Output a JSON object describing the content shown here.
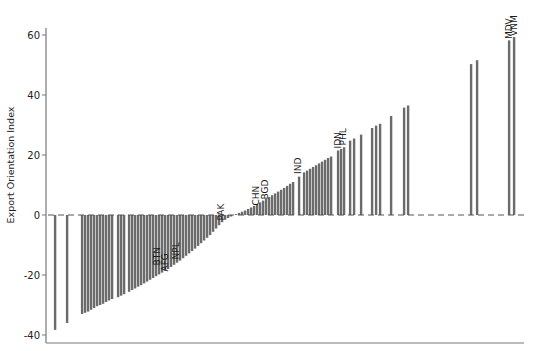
{
  "chart_data": {
    "type": "bar",
    "title": "",
    "xlabel": "",
    "ylabel": "Export Orientation Index",
    "ylim": [
      -43,
      63
    ],
    "yticks": [
      -40,
      -20,
      0,
      20,
      40,
      60
    ],
    "grid": false,
    "legend": null,
    "zero_line": "dashed",
    "bar_color": "#6b6b6b",
    "annotations": [
      {
        "label": "BTN",
        "x": 157,
        "value": -17.5
      },
      {
        "label": "AFG",
        "x": 165,
        "value": -19.5
      },
      {
        "label": "NPL",
        "x": 176,
        "value": -15.5
      },
      {
        "label": "PAK",
        "x": 221,
        "value": -2.5
      },
      {
        "label": "CHN",
        "x": 256,
        "value": 2.5
      },
      {
        "label": "BGD",
        "x": 265,
        "value": 4.5
      },
      {
        "label": "IND",
        "x": 298,
        "value": 13
      },
      {
        "label": "IDN",
        "x": 338,
        "value": 21.5
      },
      {
        "label": "PHL",
        "x": 343,
        "value": 22.5
      },
      {
        "label": "MDV",
        "x": 509,
        "value": 58
      },
      {
        "label": "VNM",
        "x": 514,
        "value": 59
      }
    ],
    "bars": [
      {
        "x": 55,
        "value": -38.3
      },
      {
        "x": 67,
        "value": -36.0
      },
      {
        "x": 82,
        "value": -33.0
      },
      {
        "x": 85,
        "value": -32.6
      },
      {
        "x": 88,
        "value": -32.2
      },
      {
        "x": 91,
        "value": -31.6
      },
      {
        "x": 94,
        "value": -31.0
      },
      {
        "x": 97,
        "value": -30.4
      },
      {
        "x": 100,
        "value": -30.0
      },
      {
        "x": 103,
        "value": -29.6
      },
      {
        "x": 106,
        "value": -29.0
      },
      {
        "x": 109,
        "value": -28.5
      },
      {
        "x": 112,
        "value": -28.0
      },
      {
        "x": 118,
        "value": -27.4
      },
      {
        "x": 121,
        "value": -26.9
      },
      {
        "x": 124,
        "value": -26.4
      },
      {
        "x": 129,
        "value": -25.6
      },
      {
        "x": 132,
        "value": -25.0
      },
      {
        "x": 135,
        "value": -24.5
      },
      {
        "x": 138,
        "value": -23.9
      },
      {
        "x": 141,
        "value": -23.4
      },
      {
        "x": 144,
        "value": -22.8
      },
      {
        "x": 147,
        "value": -22.2
      },
      {
        "x": 150,
        "value": -21.6
      },
      {
        "x": 153,
        "value": -21.0
      },
      {
        "x": 156,
        "value": -20.4
      },
      {
        "x": 159,
        "value": -19.8
      },
      {
        "x": 162,
        "value": -19.2
      },
      {
        "x": 165,
        "value": -18.6
      },
      {
        "x": 168,
        "value": -18.0
      },
      {
        "x": 171,
        "value": -17.3
      },
      {
        "x": 174,
        "value": -16.6
      },
      {
        "x": 177,
        "value": -15.9
      },
      {
        "x": 180,
        "value": -15.2
      },
      {
        "x": 183,
        "value": -14.4
      },
      {
        "x": 186,
        "value": -13.6
      },
      {
        "x": 189,
        "value": -12.8
      },
      {
        "x": 192,
        "value": -12.0
      },
      {
        "x": 195,
        "value": -11.2
      },
      {
        "x": 198,
        "value": -10.3
      },
      {
        "x": 201,
        "value": -9.4
      },
      {
        "x": 204,
        "value": -8.5
      },
      {
        "x": 207,
        "value": -7.6
      },
      {
        "x": 210,
        "value": -6.7
      },
      {
        "x": 213,
        "value": -5.6
      },
      {
        "x": 216,
        "value": -4.5
      },
      {
        "x": 219,
        "value": -3.4
      },
      {
        "x": 222,
        "value": -2.4
      },
      {
        "x": 225,
        "value": -1.6
      },
      {
        "x": 228,
        "value": -1.0
      },
      {
        "x": 231,
        "value": -0.5
      },
      {
        "x": 236,
        "value": 0.3
      },
      {
        "x": 239,
        "value": 0.7
      },
      {
        "x": 242,
        "value": 1.1
      },
      {
        "x": 245,
        "value": 1.5
      },
      {
        "x": 248,
        "value": 2.0
      },
      {
        "x": 251,
        "value": 2.5
      },
      {
        "x": 254,
        "value": 3.0
      },
      {
        "x": 257,
        "value": 3.6
      },
      {
        "x": 260,
        "value": 4.2
      },
      {
        "x": 263,
        "value": 4.8
      },
      {
        "x": 266,
        "value": 5.4
      },
      {
        "x": 269,
        "value": 6.0
      },
      {
        "x": 272,
        "value": 6.6
      },
      {
        "x": 275,
        "value": 7.2
      },
      {
        "x": 278,
        "value": 7.8
      },
      {
        "x": 281,
        "value": 8.4
      },
      {
        "x": 284,
        "value": 9.0
      },
      {
        "x": 287,
        "value": 9.7
      },
      {
        "x": 290,
        "value": 10.4
      },
      {
        "x": 293,
        "value": 11.0
      },
      {
        "x": 299,
        "value": 12.8
      },
      {
        "x": 304,
        "value": 14.2
      },
      {
        "x": 307,
        "value": 14.8
      },
      {
        "x": 310,
        "value": 15.4
      },
      {
        "x": 313,
        "value": 16.0
      },
      {
        "x": 316,
        "value": 16.6
      },
      {
        "x": 319,
        "value": 17.2
      },
      {
        "x": 322,
        "value": 17.8
      },
      {
        "x": 325,
        "value": 18.4
      },
      {
        "x": 328,
        "value": 19.0
      },
      {
        "x": 331,
        "value": 19.5
      },
      {
        "x": 338,
        "value": 21.5
      },
      {
        "x": 341,
        "value": 22.0
      },
      {
        "x": 344,
        "value": 22.6
      },
      {
        "x": 350,
        "value": 24.8
      },
      {
        "x": 354,
        "value": 25.5
      },
      {
        "x": 361,
        "value": 26.8
      },
      {
        "x": 372,
        "value": 29.0
      },
      {
        "x": 376,
        "value": 29.8
      },
      {
        "x": 380,
        "value": 30.4
      },
      {
        "x": 391,
        "value": 33.0
      },
      {
        "x": 404,
        "value": 35.8
      },
      {
        "x": 408,
        "value": 36.5
      },
      {
        "x": 471,
        "value": 50.3
      },
      {
        "x": 477,
        "value": 51.6
      },
      {
        "x": 509,
        "value": 58.2
      },
      {
        "x": 514,
        "value": 59.3
      }
    ]
  },
  "axes": {
    "y_title": "Export Orientation Index",
    "y_tick_labels": [
      "-40",
      "-20",
      "0",
      "20",
      "40",
      "60"
    ]
  }
}
